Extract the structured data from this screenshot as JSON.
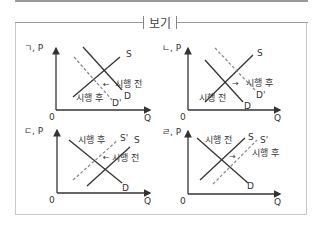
{
  "heading": "보기",
  "colors": {
    "line": "#333333",
    "dashed": "#888888",
    "axis": "#333333",
    "frame": "#c8c8c8"
  },
  "graphs": [
    {
      "id": "giyeok",
      "label": "ㄱ, P",
      "origin": "0",
      "x_axis": "Q",
      "curves": {
        "S": "S",
        "D": "D",
        "D_prime": "D'"
      },
      "before": "시행 전",
      "after": "시행 후",
      "arrow": "←",
      "description": "Demand shifts left from D to D' (dashed); supply S unchanged"
    },
    {
      "id": "nieun",
      "label": "ㄴ, P",
      "origin": "0",
      "x_axis": "Q",
      "curves": {
        "S": "S",
        "D": "D",
        "D_prime": "D'"
      },
      "before": "시행 전",
      "after": "시행 후",
      "arrow": "→",
      "description": "Demand shifts right from D to D' (dashed); supply S unchanged"
    },
    {
      "id": "digeut",
      "label": "ㄷ, P",
      "origin": "0",
      "x_axis": "Q",
      "curves": {
        "S": "S",
        "S_prime": "S'",
        "D": "D"
      },
      "before": "시행 전",
      "after": "시행 후",
      "arrow": "←",
      "description": "Supply shifts left from S to S' (dashed); demand D unchanged"
    },
    {
      "id": "rieul",
      "label": "ㄹ, P",
      "origin": "0",
      "x_axis": "Q",
      "curves": {
        "S": "S",
        "S_prime": "S'",
        "D": "D"
      },
      "before": "시행 전",
      "after": "시행 후",
      "arrow": "→",
      "description": "Supply shifts right from S to S' (dashed); demand D unchanged"
    }
  ]
}
